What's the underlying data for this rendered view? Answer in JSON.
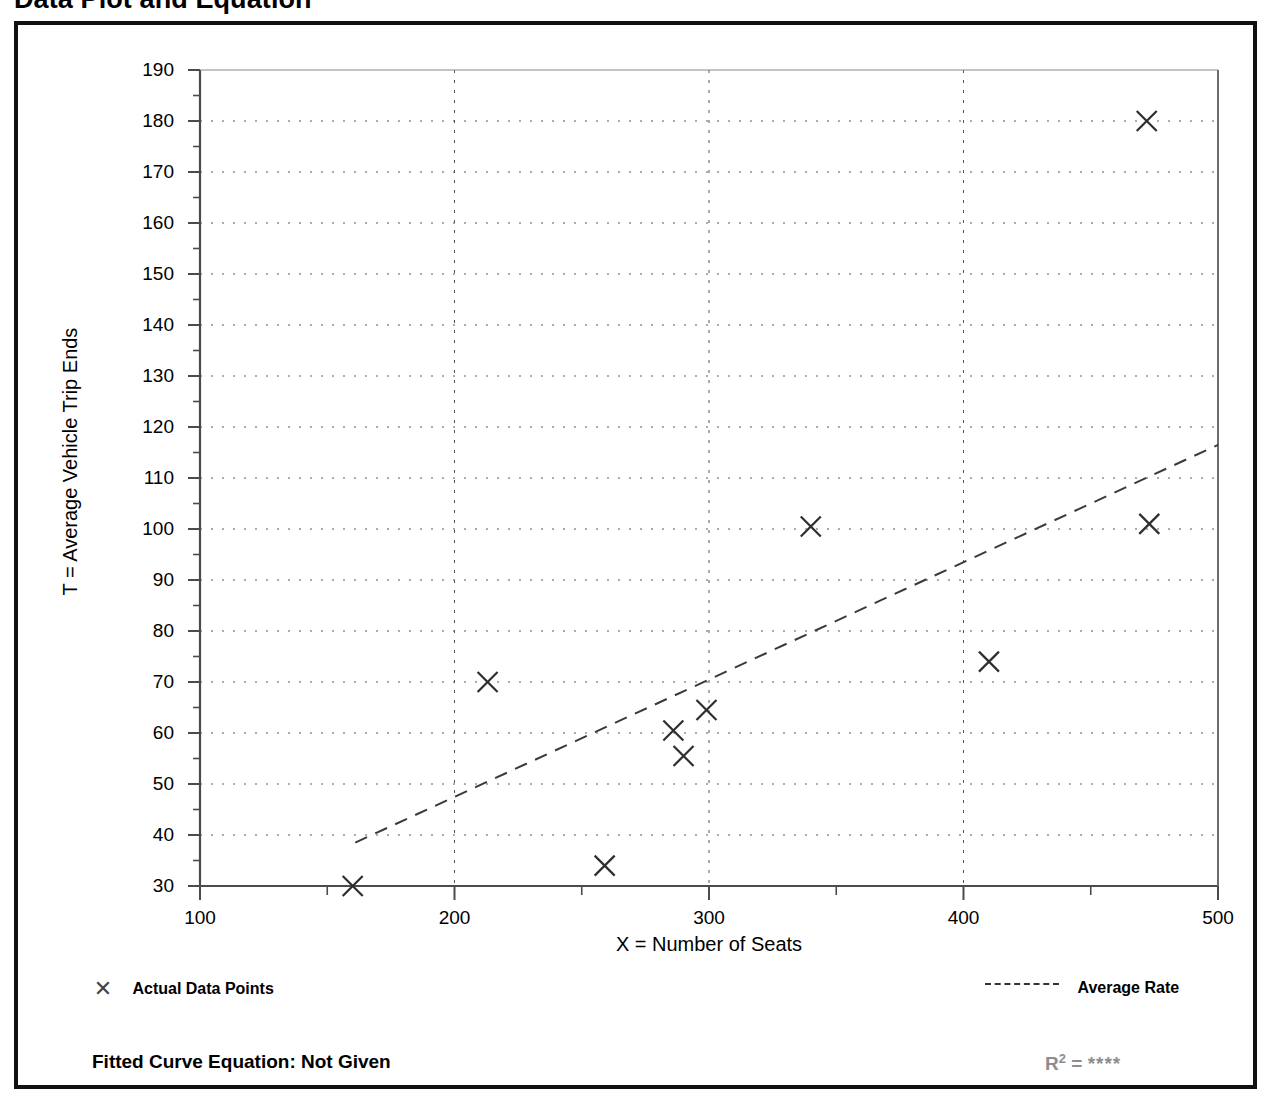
{
  "page": {
    "title": "Data Plot and Equation"
  },
  "chart_data": {
    "type": "scatter",
    "title": "Data Plot and Equation",
    "xlabel": "X = Number of Seats",
    "ylabel": "T = Average Vehicle Trip Ends",
    "xlim": [
      100,
      500
    ],
    "ylim": [
      30,
      190
    ],
    "x_ticks": [
      100,
      200,
      300,
      400,
      500
    ],
    "x_tick_labels": [
      "100",
      "200",
      "300",
      "400",
      "500"
    ],
    "x_minor_tick_step": 50,
    "y_ticks": [
      30,
      40,
      50,
      60,
      70,
      80,
      90,
      100,
      110,
      120,
      130,
      140,
      150,
      160,
      170,
      180,
      190
    ],
    "y_tick_labels": [
      "30",
      "40",
      "50",
      "60",
      "70",
      "80",
      "90",
      "100",
      "110",
      "120",
      "130",
      "140",
      "150",
      "160",
      "170",
      "180",
      "190"
    ],
    "y_minor_tick_step": 5,
    "grid": "dotted horizontal at every labeled y-tick; dashed vertical at 200, 300, 400",
    "grid_x_lines": [
      200,
      300,
      400
    ],
    "legend_position": "below plot, left and right",
    "series": [
      {
        "name": "Actual Data Points",
        "marker": "x",
        "points": [
          {
            "x": 160,
            "y": 30.0
          },
          {
            "x": 213,
            "y": 70.0
          },
          {
            "x": 259,
            "y": 34.0
          },
          {
            "x": 286,
            "y": 60.5
          },
          {
            "x": 290,
            "y": 55.5
          },
          {
            "x": 299,
            "y": 64.5
          },
          {
            "x": 340,
            "y": 100.5
          },
          {
            "x": 410,
            "y": 74.0
          },
          {
            "x": 472,
            "y": 180.0
          },
          {
            "x": 473,
            "y": 101.0
          }
        ]
      },
      {
        "name": "Average Rate",
        "style": "dashed",
        "line": [
          {
            "x": 161,
            "y": 38.5
          },
          {
            "x": 500,
            "y": 116.5
          }
        ]
      }
    ],
    "annotations": {
      "fitted_curve_equation": "Fitted Curve Equation:  Not Given",
      "r_squared": "****"
    }
  },
  "legend": {
    "data_points_label": "Actual Data Points",
    "average_rate_label": "Average Rate",
    "data_points_marker": "x-marker-icon",
    "average_rate_marker": "dashed-line-icon"
  },
  "footer": {
    "equation_label": "Fitted Curve Equation:  Not Given",
    "r2_prefix": "R",
    "r2_exponent": "2",
    "r2_equals": " = ",
    "r2_value": "****"
  }
}
